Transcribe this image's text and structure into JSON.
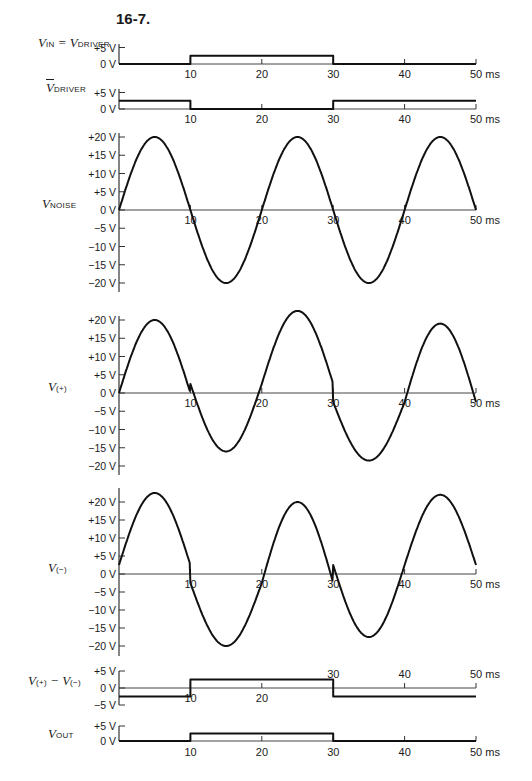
{
  "figure": {
    "title": "16-7.",
    "time_unit": "ms",
    "x_ticks": [
      10,
      20,
      30,
      40,
      50
    ]
  },
  "panels": [
    {
      "id": "vin",
      "label_main": "V",
      "label_sub": "IN",
      "label_rest": " = V",
      "label_sub2": "DRIVER"
    },
    {
      "id": "vdriver_bar",
      "label_main": "V",
      "label_sub": "DRIVER",
      "overline": true
    },
    {
      "id": "vnoise",
      "label_main": "V",
      "label_sub": "NOISE"
    },
    {
      "id": "vplus",
      "label_main": "V",
      "label_sub": "(+)"
    },
    {
      "id": "vminus",
      "label_main": "V",
      "label_sub": "(−)"
    },
    {
      "id": "vdiff",
      "label_main": "V",
      "label_sub": "(+)",
      "label_rest": " − V",
      "label_sub2": "(−)"
    },
    {
      "id": "vout",
      "label_main": "V",
      "label_sub": "OUT"
    }
  ],
  "chart_data": [
    {
      "type": "line",
      "name": "V_IN = V_DRIVER",
      "xlabel": "ms",
      "ylabel": "V",
      "yticks": [
        "+5 V",
        "0 V"
      ],
      "ylim": [
        0,
        5
      ],
      "xlim": [
        0,
        50
      ],
      "x": [
        0,
        10,
        10,
        30,
        30,
        50
      ],
      "y": [
        0,
        0,
        2.5,
        2.5,
        0,
        0
      ]
    },
    {
      "type": "line",
      "name": "V_DRIVER (inverted)",
      "xlabel": "ms",
      "ylabel": "V",
      "yticks": [
        "+5 V",
        "0 V"
      ],
      "ylim": [
        0,
        5
      ],
      "xlim": [
        0,
        50
      ],
      "x": [
        0,
        10,
        10,
        30,
        30,
        50
      ],
      "y": [
        2.5,
        2.5,
        0,
        0,
        2.5,
        2.5
      ]
    },
    {
      "type": "line",
      "name": "V_NOISE",
      "xlabel": "ms",
      "ylabel": "V",
      "yticks": [
        "+20 V",
        "+15 V",
        "+10 V",
        "+5 V",
        "0 V",
        "−5 V",
        "−10 V",
        "−15 V",
        "−20 V"
      ],
      "ylim": [
        -20,
        20
      ],
      "xlim": [
        0,
        50
      ],
      "description": "sine wave, amplitude 20 V, period 20 ms",
      "x": [
        0,
        5,
        10,
        15,
        20,
        25,
        30,
        35,
        40,
        45,
        50
      ],
      "y": [
        0,
        20,
        0,
        -20,
        0,
        20,
        0,
        -20,
        0,
        20,
        0
      ]
    },
    {
      "type": "line",
      "name": "V(+)",
      "xlabel": "ms",
      "ylabel": "V",
      "yticks": [
        "+20 V",
        "+15 V",
        "+10 V",
        "+5 V",
        "0 V",
        "−5 V",
        "−10 V",
        "−15 V",
        "−20 V"
      ],
      "ylim": [
        -20,
        20
      ],
      "xlim": [
        0,
        50
      ],
      "description": "V_NOISE plus offset: −2.5 V for 0–10 and 30–50 ms, +2.5 V for 10–30 ms",
      "x": [
        0,
        5,
        10,
        15,
        20,
        25,
        30,
        35,
        40,
        45,
        50
      ],
      "y": [
        0,
        20,
        0,
        -16,
        2.5,
        22.5,
        0,
        -18.5,
        -2.5,
        19,
        0
      ]
    },
    {
      "type": "line",
      "name": "V(−)",
      "xlabel": "ms",
      "ylabel": "V",
      "yticks": [
        "+20 V",
        "+15 V",
        "+10 V",
        "+5 V",
        "0 V",
        "−5 V",
        "−10 V",
        "−15 V",
        "−20 V"
      ],
      "ylim": [
        -20,
        20
      ],
      "xlim": [
        0,
        50
      ],
      "description": "V_NOISE plus offset: +2.5 V for 0–10 and 30–50 ms, −2.5 V for 10–30 ms",
      "x": [
        0,
        5,
        10,
        15,
        20,
        25,
        30,
        35,
        40,
        45,
        50
      ],
      "y": [
        2.5,
        22.5,
        0,
        -20,
        0,
        20,
        0,
        -17.5,
        0,
        22,
        0
      ]
    },
    {
      "type": "line",
      "name": "V(+) − V(−)",
      "xlabel": "ms",
      "ylabel": "V",
      "yticks": [
        "+5 V",
        "0 V",
        "−5 V"
      ],
      "ylim": [
        -5,
        5
      ],
      "xlim": [
        0,
        50
      ],
      "x": [
        0,
        10,
        10,
        30,
        30,
        50
      ],
      "y": [
        -2.5,
        -2.5,
        2.5,
        2.5,
        -2.5,
        -2.5
      ]
    },
    {
      "type": "line",
      "name": "V_OUT",
      "xlabel": "ms",
      "ylabel": "V",
      "yticks": [
        "+5 V",
        "0 V"
      ],
      "ylim": [
        0,
        5
      ],
      "xlim": [
        0,
        50
      ],
      "x": [
        0,
        10,
        10,
        30,
        30,
        50
      ],
      "y": [
        0,
        0,
        2.5,
        2.5,
        0,
        0
      ]
    }
  ]
}
